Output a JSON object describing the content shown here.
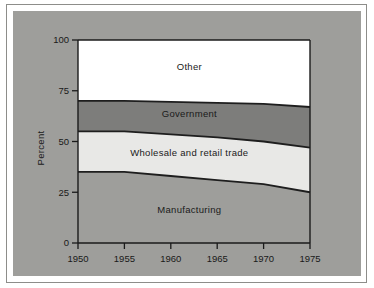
{
  "figure": {
    "background_color": "#ffffff",
    "panel_color": "#9e9e9b",
    "border_color": "#8d8d8a"
  },
  "chart_data": {
    "type": "area",
    "stacked": true,
    "title": "",
    "subtitle": "",
    "xlabel": "",
    "ylabel": "Percent",
    "xlim": [
      1950,
      1975
    ],
    "ylim": [
      0,
      100
    ],
    "grid": false,
    "legend_position": "inline-labels",
    "x": [
      1950,
      1955,
      1960,
      1965,
      1970,
      1975
    ],
    "xticks": [
      1950,
      1955,
      1960,
      1965,
      1970,
      1975
    ],
    "xtick_labels": [
      "1950",
      "1955",
      "1960",
      "1965",
      "1970",
      "1975"
    ],
    "yticks": [
      0,
      25,
      50,
      75,
      100
    ],
    "ytick_labels": [
      "0",
      "25",
      "50",
      "75",
      "100"
    ],
    "series": [
      {
        "name": "Manufacturing",
        "label": "Manufacturing",
        "color": "#9e9e9b",
        "values": [
          35,
          35,
          33,
          31,
          29,
          25
        ],
        "cumulative": [
          35,
          35,
          33,
          31,
          29,
          25
        ]
      },
      {
        "name": "Wholesale and retail trade",
        "label": "Wholesale and retail trade",
        "color": "#e8e8e6",
        "values": [
          20,
          20,
          20.5,
          21,
          21,
          22
        ],
        "cumulative": [
          55,
          55,
          53.5,
          52,
          50,
          47
        ]
      },
      {
        "name": "Government",
        "label": "Government",
        "color": "#7d7d7b",
        "values": [
          15,
          15,
          16,
          17,
          18.5,
          20
        ],
        "cumulative": [
          70,
          70,
          69.5,
          69,
          68.5,
          67
        ]
      },
      {
        "name": "Other",
        "label": "Other",
        "color": "#ffffff",
        "values": [
          30,
          30,
          30.5,
          31,
          31.5,
          33
        ],
        "cumulative": [
          100,
          100,
          100,
          100,
          100,
          100
        ]
      }
    ],
    "annotations": [
      {
        "text": "Other",
        "x": 1962,
        "y": 85
      },
      {
        "text": "Government",
        "x": 1962,
        "y": 62
      },
      {
        "text": "Wholesale and retail trade",
        "x": 1962,
        "y": 43
      },
      {
        "text": "Manufacturing",
        "x": 1962,
        "y": 15
      }
    ]
  }
}
